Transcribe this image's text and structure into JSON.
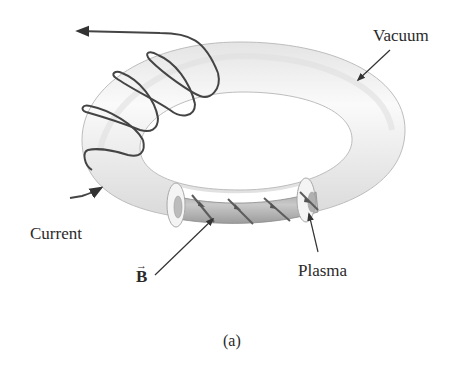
{
  "figure": {
    "caption": "(a)",
    "labels": {
      "vacuum": "Vacuum",
      "current": "Current",
      "plasma": "Plasma",
      "magnetic_field": "B",
      "magnetic_field_vector_mark": "→"
    },
    "colors": {
      "background": "#ffffff",
      "torus_fill": "#f2f2f2",
      "torus_shade": "#d6d6d6",
      "plasma_fill": "#bdbdbd",
      "wire": "#444444",
      "text": "#2a2a2a"
    },
    "coil_turns": 4,
    "field_line_arrows": 4
  }
}
